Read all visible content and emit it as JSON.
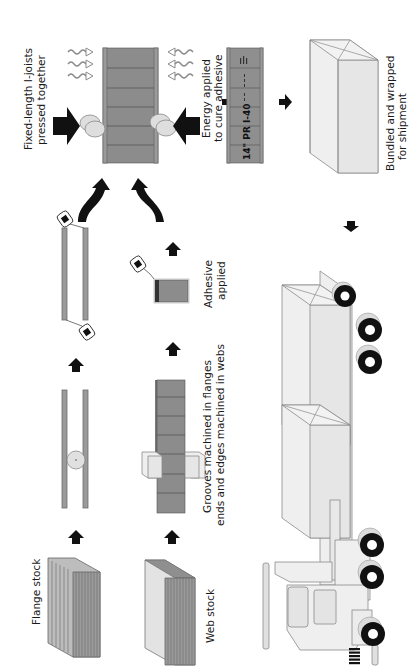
{
  "diagram": {
    "orientation": "rotated 90deg clockwise (text reads bottom-to-top)",
    "steps": [
      {
        "id": "flange-stock",
        "label": "Flange stock"
      },
      {
        "id": "web-stock",
        "label": "Web stock"
      },
      {
        "id": "machining",
        "label_line1": "Grooves machined in flanges",
        "label_line2": "ends and edges machined in webs"
      },
      {
        "id": "adhesive",
        "label_line1": "Adhesive",
        "label_line2": "applied"
      },
      {
        "id": "press",
        "label_line1": "Fixed-length I-joists",
        "label_line2": "pressed together"
      },
      {
        "id": "cure",
        "label_line1": "Energy applied",
        "label_line2": "to cure adhesive"
      },
      {
        "id": "bundle",
        "label_line1": "Bundled and wrapped",
        "label_line2": "for shipment"
      },
      {
        "id": "truck",
        "label": "Shipping truck"
      }
    ],
    "joist_stamp": "14\" PR I-40",
    "colors": {
      "wood_dark": "#8c8c8c",
      "wood_light": "#e6e6e6",
      "arrow": "#111111",
      "background": "#ffffff"
    }
  }
}
